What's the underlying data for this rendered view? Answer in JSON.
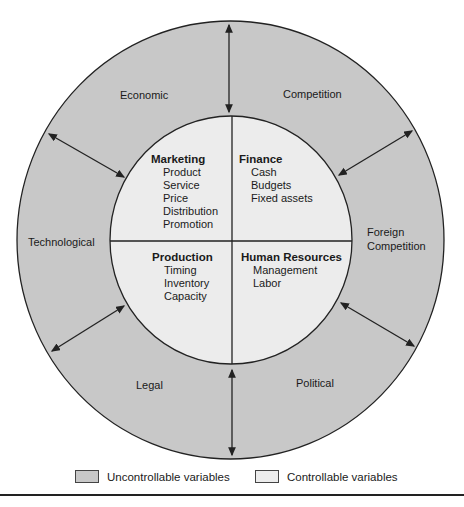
{
  "colors": {
    "uncontrollable": "#c8c8c8",
    "controllable": "#ececec",
    "line": "#222222"
  },
  "outer_labels": {
    "economic": "Economic",
    "competition": "Competition",
    "technological": "Technological",
    "foreign_1": "Foreign",
    "foreign_2": "Competition",
    "legal": "Legal",
    "political": "Political"
  },
  "quadrants": {
    "marketing": {
      "title": "Marketing",
      "items": [
        "Product",
        "Service",
        "Price",
        "Distribution",
        "Promotion"
      ]
    },
    "finance": {
      "title": "Finance",
      "items": [
        "Cash",
        "Budgets",
        "Fixed assets"
      ]
    },
    "production": {
      "title": "Production",
      "items": [
        "Timing",
        "Inventory",
        "Capacity"
      ]
    },
    "hr": {
      "title": "Human Resources",
      "items": [
        "Management",
        "Labor"
      ]
    }
  },
  "legend": {
    "uncontrollable": "Uncontrollable variables",
    "controllable": "Controllable variables"
  }
}
